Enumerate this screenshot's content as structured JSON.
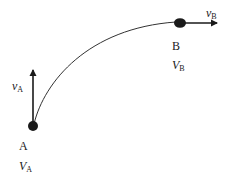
{
  "diagram": {
    "type": "motion-along-curved-path",
    "colors": {
      "stroke": "#1a1a1a",
      "background": "#ffffff"
    },
    "points": [
      {
        "id": "A",
        "label": "A",
        "potential_symbol": "V",
        "potential_subscript": "A",
        "velocity_symbol": "v",
        "velocity_subscript": "A",
        "velocity_direction": "up"
      },
      {
        "id": "B",
        "label": "B",
        "potential_symbol": "V",
        "potential_subscript": "B",
        "velocity_symbol": "v",
        "velocity_subscript": "B",
        "velocity_direction": "right"
      }
    ],
    "path": {
      "from": "A",
      "to": "B",
      "shape": "curved arc"
    }
  }
}
